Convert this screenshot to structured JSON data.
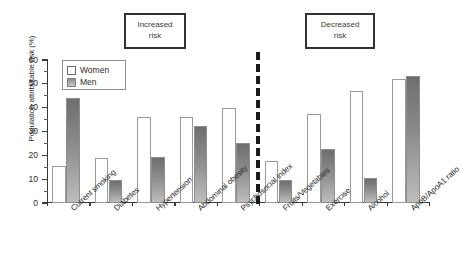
{
  "chart_data": {
    "type": "bar",
    "title": "",
    "xlabel": "",
    "ylabel": "Population attributable risk (%)",
    "ylim": [
      0,
      60
    ],
    "yticks": [
      0,
      10,
      20,
      30,
      40,
      50,
      60
    ],
    "grid": false,
    "legend_position": "top-left",
    "categories": [
      "Current smoking",
      "Diabetes",
      "Hypertension",
      "Abdominal obesity",
      "Psychosocial index",
      "Fruits/Vegetables",
      "Exercise",
      "Alcohol",
      "ApoB/ApoA1 ratio"
    ],
    "series": [
      {
        "name": "Women",
        "values": [
          15.5,
          19,
          36,
          36,
          40,
          17.5,
          37.5,
          47,
          52
        ]
      },
      {
        "name": "Men",
        "values": [
          44,
          9.8,
          19.5,
          32.5,
          25,
          9.8,
          22.5,
          10.5,
          53.5
        ]
      }
    ],
    "annotations": [
      {
        "id": "increased",
        "line1": "Increased",
        "line2": "risk"
      },
      {
        "id": "decreased",
        "line1": "Decreased",
        "line2": "risk"
      }
    ],
    "divider": {
      "style": "dashed",
      "after_category": "Fruits/Vegetables"
    }
  },
  "legend": {
    "women_label": "Women",
    "men_label": "Men"
  },
  "yticklabels": {
    "t0": "0",
    "t10": "10",
    "t20": "20",
    "t30": "30",
    "t40": "40",
    "t50": "50",
    "t60": "60"
  },
  "xticklabels": {
    "c0": "Current smoking",
    "c1": "Diabetes",
    "c2": "Hypertension",
    "c3": "Abdominal obesity",
    "c4": "Psychosocial index",
    "c5": "Fruits/Vegetables",
    "c6": "Exercise",
    "c7": "Alcohol",
    "c8": "ApoB/ApoA1 ratio"
  },
  "annotations": {
    "increased_l1": "Increased",
    "increased_l2": "risk",
    "decreased_l1": "Decreased",
    "decreased_l2": "risk"
  },
  "axis": {
    "ylabel": "Population attributable risk (%)"
  }
}
